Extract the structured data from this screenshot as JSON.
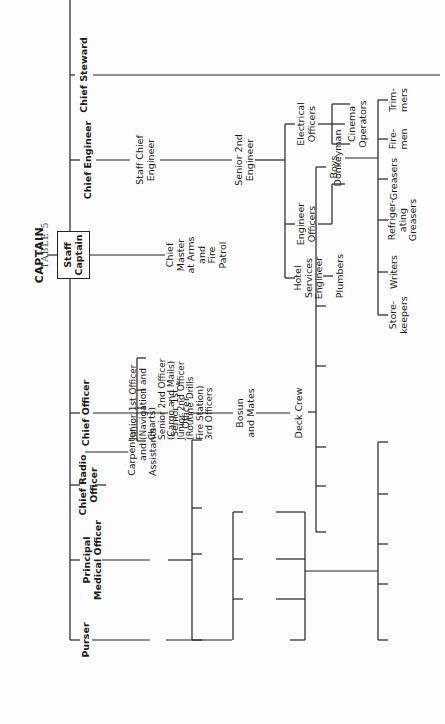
{
  "table_title": "TABLE 5",
  "top": {
    "captain": "CAPTAIN",
    "staff_captain": "Staff\nCaptain"
  },
  "heads": {
    "chief_steward": "Chief Steward",
    "chief_engineer": "Chief Engineer",
    "chief_officer": "Chief Officer",
    "chief_radio_officer": "Chief Radio\nOfficer",
    "principal_medical_officer": "Principal\nMedical Officer",
    "purser": "Purser"
  },
  "engineering": {
    "staff_chief_engineer": "Staff Chief\nEngineer",
    "senior_2nd_engineer": "Senior 2nd\nEngineer",
    "electrical_officers": "Electrical\nOfficers",
    "engineer_officers": "Engineer\nOfficers",
    "hotel_services_engineer": "Hotel\nServices\nEngineer",
    "plumbers": "Plumbers",
    "donkeyman": "Donkeyman",
    "cinema_operators": "Cinema\nOperators",
    "ratings": [
      "Trim-\nmers",
      "Fire-\nmen",
      "Greasers",
      "Refriger-\nating\nGreasers",
      "Writers",
      "Store-\nkeepers"
    ]
  },
  "deck": {
    "master_at_arms": "Chief\nMaster\nat Arms\nand\nFire\nPatrol",
    "arrow": "→",
    "junior_officers": [
      "Junior 1st Officer\n(Navigation and\nCharts)",
      "Senior 2nd Officer\n(Cargo and Mails)",
      "Junior 2nd Officer\n(Routine Drills\nFire Station)",
      "3rd Officers"
    ],
    "senior_1st_officer": "Senior 1st\nOfficer",
    "carpenter": "Carpenter\nand\nAssistants",
    "bosun": "Bosun\nand Mates",
    "deck_crew": "Deck Crew",
    "crew": [
      "Boys",
      "Ordinary\nseamen",
      "Able-\nseamen",
      "Quarter-\nmasters",
      "Lamp-\ntrimmer",
      "Store-\nkeeper"
    ]
  },
  "radio": {
    "radio_officers": "Radio Officers"
  },
  "medical": {
    "surgeon": "Surgeon",
    "staff": [
      "Hospital\nAttendts.",
      "Dis-\npensers",
      "Nursing\nSisters",
      "Physio-\ntherapist"
    ]
  },
  "purser_dept": {
    "staff_pursers": "Staff Pursers",
    "crew_purser": "Crew\nPurser",
    "tourist_class_purser": "Tourist\nClass\nPurser",
    "cabin_class_purser": "Cabin\nClass\nPurser",
    "travel_bureau": "Travel Bureau\n(Lady Asst.\nPursers,\nFirst, Cabin,\nand Tourist)",
    "services": [
      "Tele-\nphonists",
      "Inter-\npreters",
      "Printers",
      "Baggage\nMasters",
      "Musicians"
    ]
  }
}
